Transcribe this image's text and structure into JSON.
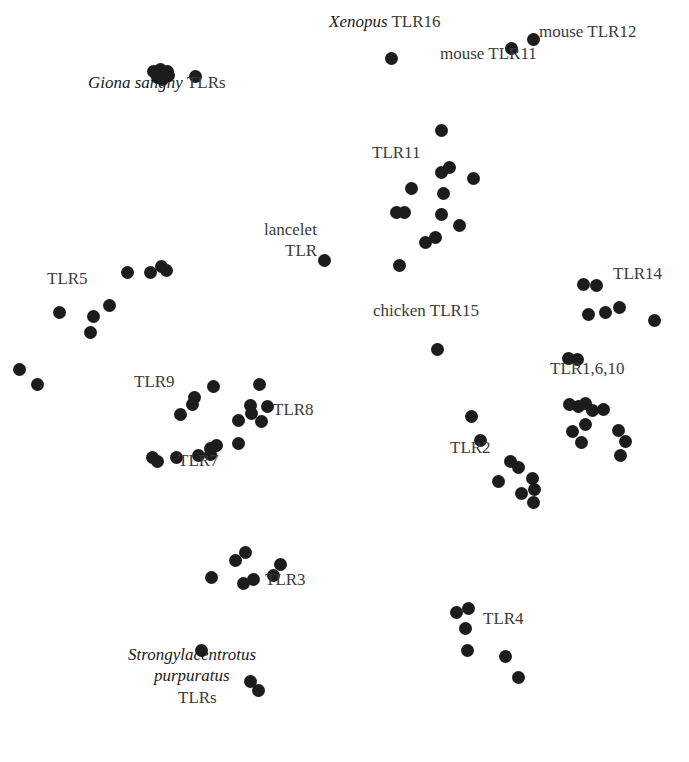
{
  "figure": {
    "type": "cluster-map",
    "dot_color": "#1c1c1c",
    "label_color": "#3a3a3a",
    "background": "#ffffff"
  },
  "labels": [
    {
      "id": "giona",
      "italic": "Giona sangny",
      "text": " TLRs",
      "x": 88,
      "y": 88
    },
    {
      "id": "xenopus",
      "italic": "Xenopus",
      "text": " TLR16",
      "x": 329,
      "y": 27
    },
    {
      "id": "mouse12",
      "italic": "",
      "text": "mouse TLR12",
      "x": 539,
      "y": 37
    },
    {
      "id": "mouse11",
      "italic": "",
      "text": "mouse TLR11",
      "x": 440,
      "y": 59
    },
    {
      "id": "tlr11",
      "italic": "",
      "text": "TLR11",
      "x": 372,
      "y": 158
    },
    {
      "id": "lancelet1",
      "italic": "",
      "text": "lancelet",
      "x": 264,
      "y": 235
    },
    {
      "id": "lancelet2",
      "italic": "",
      "text": "TLR",
      "x": 285,
      "y": 256
    },
    {
      "id": "tlr5",
      "italic": "",
      "text": "TLR5",
      "x": 47,
      "y": 284
    },
    {
      "id": "tlr14",
      "italic": "",
      "text": "TLR14",
      "x": 613,
      "y": 279
    },
    {
      "id": "chicken",
      "italic": "",
      "text": "chicken TLR15",
      "x": 373,
      "y": 316
    },
    {
      "id": "tlr1610",
      "italic": "",
      "text": "TLR1,6,10",
      "x": 550,
      "y": 374
    },
    {
      "id": "tlr9",
      "italic": "",
      "text": "TLR9",
      "x": 134,
      "y": 387
    },
    {
      "id": "tlr8",
      "italic": "",
      "text": "TLR8",
      "x": 273,
      "y": 415
    },
    {
      "id": "tlr2",
      "italic": "",
      "text": "TLR2",
      "x": 450,
      "y": 453
    },
    {
      "id": "tlr7",
      "italic": "",
      "text": "TLR7",
      "x": 178,
      "y": 466
    },
    {
      "id": "tlr3",
      "italic": "",
      "text": "TLR3",
      "x": 265,
      "y": 585
    },
    {
      "id": "tlr4",
      "italic": "",
      "text": "TLR4",
      "x": 483,
      "y": 624
    },
    {
      "id": "spur1",
      "italic": "Strongylacentrotus",
      "text": "",
      "x": 128,
      "y": 660
    },
    {
      "id": "spur2",
      "italic": "purpuratus",
      "text": "",
      "x": 154,
      "y": 681
    },
    {
      "id": "spur3",
      "italic": "",
      "text": "TLRs",
      "x": 178,
      "y": 703
    }
  ],
  "clusters": [
    {
      "name": "Giona sangny TLRs",
      "points": [
        [
          153,
          71
        ],
        [
          160,
          69
        ],
        [
          167,
          71
        ],
        [
          157,
          77
        ],
        [
          162,
          79
        ],
        [
          168,
          75
        ],
        [
          195,
          76
        ]
      ]
    },
    {
      "name": "Xenopus TLR16",
      "points": [
        [
          391,
          58
        ]
      ]
    },
    {
      "name": "mouse TLR11",
      "points": [
        [
          511,
          48
        ]
      ]
    },
    {
      "name": "mouse TLR12",
      "points": [
        [
          533,
          39
        ]
      ]
    },
    {
      "name": "TLR11",
      "points": [
        [
          441,
          130
        ],
        [
          441,
          172
        ],
        [
          449,
          167
        ],
        [
          473,
          178
        ],
        [
          411,
          188
        ],
        [
          443,
          193
        ],
        [
          396,
          212
        ],
        [
          404,
          212
        ],
        [
          441,
          214
        ],
        [
          459,
          225
        ],
        [
          425,
          242
        ],
        [
          435,
          237
        ],
        [
          399,
          265
        ]
      ]
    },
    {
      "name": "lancelet TLR",
      "points": [
        [
          324,
          260
        ]
      ]
    },
    {
      "name": "TLR5",
      "points": [
        [
          127,
          272
        ],
        [
          150,
          272
        ],
        [
          161,
          266
        ],
        [
          166,
          270
        ],
        [
          59,
          312
        ],
        [
          109,
          305
        ],
        [
          93,
          316
        ],
        [
          90,
          332
        ]
      ]
    },
    {
      "name": "TLR5-outliers",
      "points": [
        [
          19,
          369
        ],
        [
          37,
          384
        ]
      ]
    },
    {
      "name": "TLR14",
      "points": [
        [
          583,
          284
        ],
        [
          596,
          285
        ],
        [
          588,
          314
        ],
        [
          605,
          312
        ],
        [
          619,
          307
        ],
        [
          654,
          320
        ]
      ]
    },
    {
      "name": "chicken TLR15",
      "points": [
        [
          437,
          349
        ]
      ]
    },
    {
      "name": "TLR1,6,10",
      "points": [
        [
          568,
          358
        ],
        [
          577,
          359
        ],
        [
          569,
          404
        ],
        [
          578,
          406
        ],
        [
          585,
          403
        ],
        [
          592,
          410
        ],
        [
          603,
          409
        ],
        [
          585,
          424
        ],
        [
          572,
          431
        ],
        [
          581,
          442
        ],
        [
          618,
          430
        ],
        [
          625,
          441
        ],
        [
          620,
          455
        ]
      ]
    },
    {
      "name": "TLR9",
      "points": [
        [
          194,
          397
        ],
        [
          192,
          404
        ],
        [
          180,
          414
        ],
        [
          213,
          386
        ]
      ]
    },
    {
      "name": "TLR8",
      "points": [
        [
          259,
          384
        ],
        [
          250,
          405
        ],
        [
          251,
          413
        ],
        [
          267,
          406
        ],
        [
          238,
          420
        ],
        [
          261,
          421
        ]
      ]
    },
    {
      "name": "TLR7",
      "points": [
        [
          152,
          457
        ],
        [
          157,
          461
        ],
        [
          176,
          457
        ],
        [
          198,
          455
        ],
        [
          210,
          448
        ],
        [
          216,
          445
        ],
        [
          210,
          454
        ],
        [
          238,
          443
        ]
      ]
    },
    {
      "name": "TLR2",
      "points": [
        [
          471,
          416
        ],
        [
          480,
          440
        ],
        [
          510,
          461
        ],
        [
          518,
          467
        ],
        [
          532,
          478
        ],
        [
          534,
          489
        ],
        [
          498,
          481
        ],
        [
          521,
          493
        ],
        [
          533,
          502
        ]
      ]
    },
    {
      "name": "TLR3",
      "points": [
        [
          211,
          577
        ],
        [
          235,
          560
        ],
        [
          245,
          552
        ],
        [
          243,
          583
        ],
        [
          253,
          579
        ],
        [
          273,
          575
        ],
        [
          280,
          564
        ]
      ]
    },
    {
      "name": "TLR4",
      "points": [
        [
          456,
          612
        ],
        [
          468,
          608
        ],
        [
          465,
          628
        ],
        [
          467,
          650
        ],
        [
          505,
          656
        ],
        [
          518,
          677
        ]
      ]
    },
    {
      "name": "Strongylacentrotus purpuratus TLRs",
      "points": [
        [
          201,
          650
        ],
        [
          250,
          681
        ],
        [
          258,
          690
        ]
      ]
    }
  ]
}
